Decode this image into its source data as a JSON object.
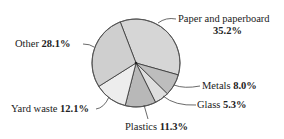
{
  "chart_data": {
    "type": "pie",
    "title": "",
    "start_angle_deg": -21,
    "direction": "clockwise",
    "slices": [
      {
        "label": "Paper and paperboard",
        "value": 35.2,
        "value_label": "35.2%",
        "color": "#d6d6d6"
      },
      {
        "label": "Metals",
        "value": 8.0,
        "value_label": "8.0%",
        "color": "#bdbdbd"
      },
      {
        "label": "Glass",
        "value": 5.3,
        "value_label": "5.3%",
        "color": "#dedede"
      },
      {
        "label": "Plastics",
        "value": 11.3,
        "value_label": "11.3%",
        "color": "#b8b8b8"
      },
      {
        "label": "Yard waste",
        "value": 12.1,
        "value_label": "12.1%",
        "color": "#ededed"
      },
      {
        "label": "Other",
        "value": 28.1,
        "value_label": "28.1%",
        "color": "#cfcfcf"
      }
    ]
  },
  "labels": {
    "paper_name": "Paper and paperboard",
    "paper_value": "35.2%",
    "metals_name": "Metals",
    "metals_value": "8.0%",
    "glass_name": "Glass",
    "glass_value": "5.3%",
    "plastics_name": "Plastics",
    "plastics_value": "11.3%",
    "yard_name": "Yard waste",
    "yard_value": "12.1%",
    "other_name": "Other",
    "other_value": "28.1%"
  }
}
